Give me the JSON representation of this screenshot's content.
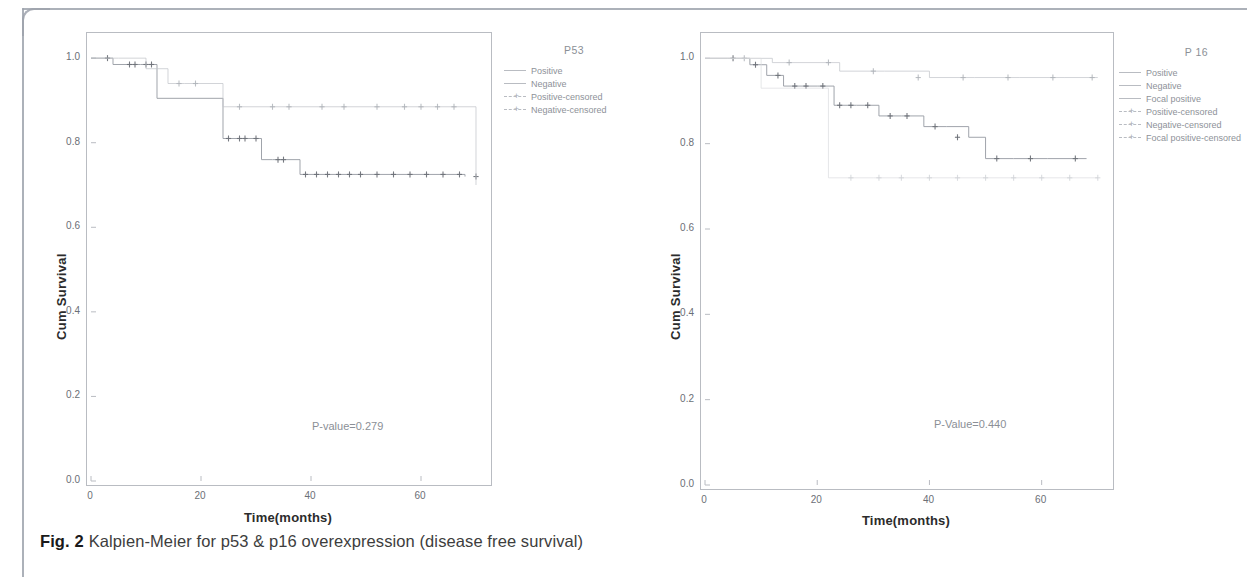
{
  "caption": {
    "label": "Fig. 2",
    "text": "Kalpien-Meier for p53 & p16 overexpression (disease free survival)"
  },
  "colors": {
    "frame": "#b9bcc2",
    "curve": "#9b9fa6",
    "curve_faint": "#cfd2d6",
    "text": "#6b6f76",
    "axis_title": "#2b2b2b"
  },
  "chart_data": [
    {
      "type": "line",
      "title": "P53",
      "panel": "left",
      "xlabel": "Time(months)",
      "ylabel": "Cum Survival",
      "xlim": [
        0,
        72
      ],
      "ylim": [
        0.0,
        1.05
      ],
      "xticks": [
        "0",
        "20",
        "40",
        "60"
      ],
      "xtick_values": [
        0,
        20,
        40,
        60
      ],
      "yticks": [
        "1.0",
        "0.8",
        "0.6",
        "0.4",
        "0.2",
        "0.0"
      ],
      "ytick_values": [
        1.0,
        0.8,
        0.6,
        0.4,
        0.2,
        0.0
      ],
      "grid": false,
      "legend_position": "right",
      "legend_title": "P53",
      "legend_entries": [
        "Positive",
        "Negative",
        "Positive-censored",
        "Negative-censored"
      ],
      "annotation": "P-value=0.279",
      "series": [
        {
          "name": "Positive",
          "style": "step",
          "x": [
            0,
            2,
            4,
            6,
            9,
            12,
            14,
            18,
            24,
            26,
            31,
            33,
            38,
            44,
            50,
            56,
            62,
            68
          ],
          "y": [
            1.0,
            1.0,
            0.985,
            0.985,
            0.985,
            0.905,
            0.905,
            0.905,
            0.81,
            0.81,
            0.76,
            0.76,
            0.725,
            0.725,
            0.725,
            0.725,
            0.725,
            0.72
          ],
          "censored_x": [
            3,
            7,
            8,
            10,
            11,
            25,
            27,
            28,
            30,
            34,
            35,
            39,
            41,
            43,
            45,
            47,
            49,
            52,
            55,
            58,
            61,
            64,
            67,
            70
          ],
          "censored_y": [
            1.0,
            0.985,
            0.985,
            0.985,
            0.985,
            0.81,
            0.81,
            0.81,
            0.81,
            0.76,
            0.76,
            0.725,
            0.725,
            0.725,
            0.725,
            0.725,
            0.725,
            0.725,
            0.725,
            0.725,
            0.725,
            0.725,
            0.725,
            0.72
          ]
        },
        {
          "name": "Negative",
          "style": "step-faint",
          "x": [
            0,
            5,
            10,
            14,
            17,
            22,
            24,
            30,
            40,
            50,
            58,
            66,
            70
          ],
          "y": [
            1.0,
            1.0,
            0.975,
            0.94,
            0.94,
            0.94,
            0.885,
            0.885,
            0.885,
            0.885,
            0.885,
            0.885,
            0.7
          ],
          "censored_x": [
            16,
            19,
            27,
            33,
            36,
            42,
            46,
            52,
            57,
            60,
            63,
            66
          ],
          "censored_y": [
            0.94,
            0.94,
            0.885,
            0.885,
            0.885,
            0.885,
            0.885,
            0.885,
            0.885,
            0.885,
            0.885,
            0.885
          ]
        }
      ]
    },
    {
      "type": "line",
      "title": "P 16",
      "panel": "right",
      "xlabel": "Time(months)",
      "ylabel": "Cum Survival",
      "xlim": [
        0,
        72
      ],
      "ylim": [
        0.0,
        1.05
      ],
      "xticks": [
        "0",
        "20",
        "40",
        "60"
      ],
      "xtick_values": [
        0,
        20,
        40,
        60
      ],
      "yticks": [
        "1.0",
        "0.8",
        "0.6",
        "0.4",
        "0.2",
        "0.0"
      ],
      "ytick_values": [
        1.0,
        0.8,
        0.6,
        0.4,
        0.2,
        0.0
      ],
      "grid": false,
      "legend_position": "right",
      "legend_title": "P 16",
      "legend_entries": [
        "Positive",
        "Negative",
        "Focal positive",
        "Positive-censored",
        "Negative-censored",
        "Focal positive-censored"
      ],
      "annotation": "P-Value=0.440",
      "series": [
        {
          "name": "Positive",
          "style": "step",
          "x": [
            0,
            4,
            8,
            11,
            14,
            20,
            23,
            27,
            31,
            35,
            39,
            43,
            47,
            50,
            55,
            61,
            68
          ],
          "y": [
            1.0,
            1.0,
            0.985,
            0.96,
            0.935,
            0.935,
            0.89,
            0.89,
            0.865,
            0.865,
            0.84,
            0.84,
            0.815,
            0.765,
            0.765,
            0.765,
            0.765
          ],
          "censored_x": [
            5,
            9,
            13,
            16,
            18,
            21,
            24,
            26,
            29,
            33,
            36,
            41,
            45,
            52,
            58,
            66
          ],
          "censored_y": [
            1.0,
            0.985,
            0.96,
            0.935,
            0.935,
            0.935,
            0.89,
            0.89,
            0.89,
            0.865,
            0.865,
            0.84,
            0.815,
            0.765,
            0.765,
            0.765
          ]
        },
        {
          "name": "Negative",
          "style": "step-faint",
          "x": [
            0,
            6,
            12,
            18,
            24,
            32,
            40,
            48,
            56,
            64,
            70
          ],
          "y": [
            1.0,
            1.0,
            0.99,
            0.99,
            0.97,
            0.97,
            0.955,
            0.955,
            0.955,
            0.955,
            0.955
          ],
          "censored_x": [
            7,
            15,
            22,
            30,
            38,
            46,
            54,
            62,
            69
          ],
          "censored_y": [
            1.0,
            0.99,
            0.99,
            0.97,
            0.955,
            0.955,
            0.955,
            0.955,
            0.955
          ]
        },
        {
          "name": "Focal positive",
          "style": "step-faintest",
          "x": [
            0,
            10,
            16,
            22,
            30,
            40,
            50,
            60,
            70
          ],
          "y": [
            1.0,
            0.93,
            0.93,
            0.72,
            0.72,
            0.72,
            0.72,
            0.72,
            0.72
          ],
          "censored_x": [
            26,
            31,
            35,
            40,
            45,
            50,
            55,
            60,
            65,
            70
          ],
          "censored_y": [
            0.72,
            0.72,
            0.72,
            0.72,
            0.72,
            0.72,
            0.72,
            0.72,
            0.72,
            0.72
          ]
        }
      ]
    }
  ]
}
